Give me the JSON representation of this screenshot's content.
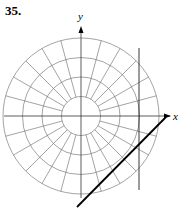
{
  "problem_number": "35.",
  "axes": {
    "x_label": "x",
    "y_label": "y"
  },
  "grid": {
    "type": "polar",
    "rings": 4,
    "ray_spacing_deg": 15,
    "inner_ring_rays": false
  },
  "lines": [
    {
      "name": "vertical-line",
      "description": "vertical line x = constant, right of center"
    },
    {
      "name": "diagonal-line",
      "description": "line with slope 1 below x-axis"
    }
  ]
}
